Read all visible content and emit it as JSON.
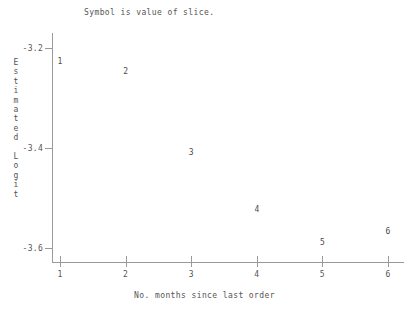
{
  "chart_data": {
    "type": "scatter",
    "title": "Symbol is value of slice.",
    "xlabel": "No. months since last order",
    "ylabel": "Estimated Logit",
    "xlim": [
      0.85,
      6.35
    ],
    "ylim": [
      -3.63,
      -3.17
    ],
    "xticks": [
      "1",
      "2",
      "3",
      "4",
      "5",
      "6"
    ],
    "xtick_values": [
      1,
      2,
      3,
      4,
      5,
      6
    ],
    "yticks": [
      "-3.2",
      "-3.4",
      "-3.6"
    ],
    "ytick_values": [
      -3.2,
      -3.4,
      -3.6
    ],
    "grid": false,
    "legend": "none",
    "point_labels_are_series_values": true,
    "x": [
      1,
      2,
      3,
      4,
      5,
      6
    ],
    "values": [
      -3.226,
      -3.246,
      -3.408,
      -3.522,
      -3.588,
      -3.566
    ],
    "points": [
      {
        "label": "1",
        "x": 1,
        "y": -3.226
      },
      {
        "label": "2",
        "x": 2,
        "y": -3.246
      },
      {
        "label": "3",
        "x": 3,
        "y": -3.408
      },
      {
        "label": "4",
        "x": 4,
        "y": -3.522
      },
      {
        "label": "5",
        "x": 5,
        "y": -3.588
      },
      {
        "label": "6",
        "x": 6,
        "y": -3.566
      }
    ]
  },
  "ylabel_chars": [
    "E",
    "s",
    "t",
    "i",
    "m",
    "a",
    "t",
    "e",
    "d",
    "",
    "L",
    "o",
    "g",
    "i",
    "t"
  ]
}
